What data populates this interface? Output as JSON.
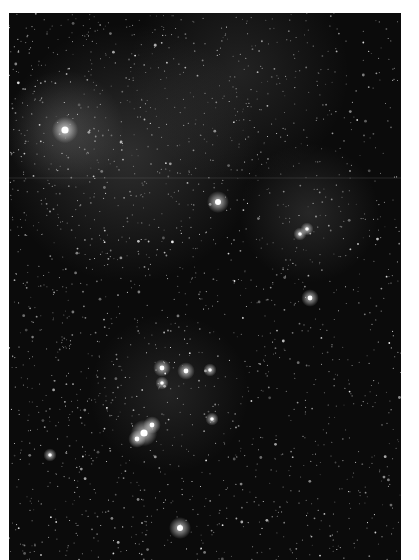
{
  "image": {
    "subject": "star field",
    "background_color": "#0b0b0b",
    "border_color": "#ffffff",
    "frame": {
      "x": 9,
      "y": 13,
      "width": 392,
      "height": 547
    },
    "artifact_line_y": 165,
    "glows": [
      {
        "cx": 55,
        "cy": 117,
        "r": 60,
        "opacity": 0.22
      },
      {
        "cx": 120,
        "cy": 140,
        "r": 130,
        "opacity": 0.18
      },
      {
        "cx": 300,
        "cy": 200,
        "r": 70,
        "opacity": 0.14
      },
      {
        "cx": 160,
        "cy": 380,
        "r": 80,
        "opacity": 0.12
      },
      {
        "cx": 230,
        "cy": 60,
        "r": 110,
        "opacity": 0.12
      }
    ],
    "bright_stars": [
      {
        "x": 56,
        "y": 117,
        "r": 6
      },
      {
        "x": 209,
        "y": 189,
        "r": 5
      },
      {
        "x": 301,
        "y": 285,
        "r": 4
      },
      {
        "x": 291,
        "y": 221,
        "r": 3
      },
      {
        "x": 298,
        "y": 216,
        "r": 3
      },
      {
        "x": 153,
        "y": 355,
        "r": 4
      },
      {
        "x": 177,
        "y": 358,
        "r": 4
      },
      {
        "x": 201,
        "y": 357,
        "r": 3
      },
      {
        "x": 153,
        "y": 370,
        "r": 3
      },
      {
        "x": 135,
        "y": 420,
        "r": 6
      },
      {
        "x": 143,
        "y": 412,
        "r": 4
      },
      {
        "x": 128,
        "y": 426,
        "r": 4
      },
      {
        "x": 41,
        "y": 442,
        "r": 3
      },
      {
        "x": 171,
        "y": 515,
        "r": 5
      },
      {
        "x": 203,
        "y": 406,
        "r": 3
      }
    ],
    "star_seed": 1337,
    "star_count": 2600
  }
}
